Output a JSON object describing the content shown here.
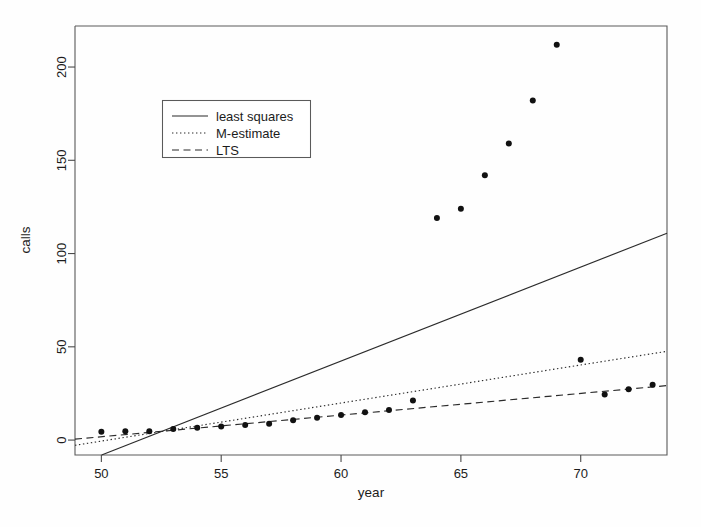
{
  "chart_data": {
    "type": "scatter",
    "title": "",
    "xlabel": "year",
    "ylabel": "calls",
    "xlim": [
      48.9,
      73.6
    ],
    "ylim": [
      -8,
      222
    ],
    "xticks": [
      50,
      55,
      60,
      65,
      70
    ],
    "yticks": [
      0,
      50,
      100,
      150,
      200
    ],
    "xtick_labels": [
      "50",
      "55",
      "60",
      "65",
      "70"
    ],
    "ytick_labels": [
      "0",
      "50",
      "100",
      "150",
      "200"
    ],
    "grid": false,
    "frame": "box",
    "legend_position": "upper-left-inside",
    "point_color": "#111111",
    "line_color": "#2b2b2b",
    "x": [
      50,
      51,
      52,
      53,
      54,
      55,
      56,
      57,
      58,
      59,
      60,
      61,
      62,
      63,
      64,
      65,
      66,
      67,
      68,
      69,
      70,
      71,
      72,
      73
    ],
    "y": [
      4.4,
      4.7,
      4.7,
      5.9,
      6.6,
      7.3,
      8.1,
      8.8,
      10.6,
      12.0,
      13.5,
      14.9,
      16.1,
      21.2,
      119.0,
      124.0,
      142.0,
      159.0,
      182.0,
      212.0,
      43.0,
      24.4,
      27.2,
      29.6
    ],
    "point_label": "calls per year (millions)",
    "series": [
      {
        "name": "least squares",
        "style": "solid",
        "type": "line",
        "intercept": -260.06,
        "slope": 5.041,
        "x_endpoints": [
          48.9,
          73.6
        ],
        "y_endpoints": [
          -13.6,
          110.9
        ]
      },
      {
        "name": "M-estimate",
        "style": "dotted",
        "type": "line",
        "intercept": -102.6,
        "slope": 2.041,
        "x_endpoints": [
          48.9,
          73.6
        ],
        "y_endpoints": [
          -2.8,
          47.6
        ]
      },
      {
        "name": "LTS",
        "style": "dashed",
        "type": "line",
        "intercept": -56.16,
        "slope": 1.159,
        "x_endpoints": [
          48.9,
          73.6
        ],
        "y_endpoints": [
          0.5,
          29.2
        ]
      }
    ]
  },
  "legend": {
    "entries": [
      {
        "label": "least squares",
        "style": "solid"
      },
      {
        "label": "M-estimate",
        "style": "dotted"
      },
      {
        "label": "LTS",
        "style": "dashed"
      }
    ]
  },
  "axes": {
    "x_title": "year",
    "y_title": "calls"
  }
}
